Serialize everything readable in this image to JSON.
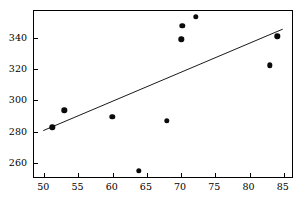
{
  "chart_data": {
    "type": "scatter",
    "title": "",
    "xlabel": "",
    "ylabel": "",
    "xlim": [
      48.5,
      86.5
    ],
    "ylim": [
      250,
      357
    ],
    "grid": false,
    "legend": null,
    "xticks": [
      50,
      55,
      60,
      65,
      70,
      75,
      80,
      85
    ],
    "yticks": [
      260,
      280,
      300,
      320,
      340
    ],
    "points": [
      {
        "x": 51.3,
        "y": 282.4
      },
      {
        "x": 53.1,
        "y": 293.2
      },
      {
        "x": 60.1,
        "y": 288.9
      },
      {
        "x": 64.0,
        "y": 254.6
      },
      {
        "x": 68.1,
        "y": 286.3
      },
      {
        "x": 70.2,
        "y": 338.4
      },
      {
        "x": 70.3,
        "y": 347.1
      },
      {
        "x": 72.3,
        "y": 352.6
      },
      {
        "x": 83.1,
        "y": 321.7
      },
      {
        "x": 84.2,
        "y": 340.3
      }
    ],
    "trend_line": {
      "type": "line",
      "x_start": 50.0,
      "y_start": 280.2,
      "x_end": 85.0,
      "y_end": 344.8
    },
    "colors": {
      "point": "#0b0b0b",
      "line": "#000000",
      "axis": "#000000",
      "background": "#ffffff"
    }
  }
}
